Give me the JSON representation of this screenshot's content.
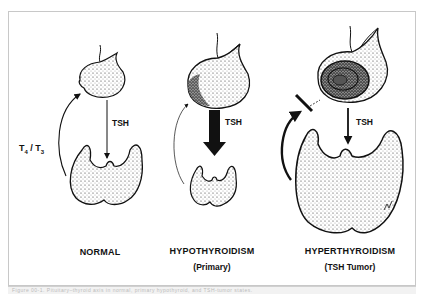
{
  "figure": {
    "panels": [
      {
        "id": "normal",
        "label": "NORMAL",
        "sublabel": "",
        "arrow_label": "TSH",
        "feedback_label": "T4 / T3",
        "feedback": "normal"
      },
      {
        "id": "hypothyroidism",
        "label": "HYPOTHYROIDISM",
        "sublabel": "(Primary)",
        "arrow_label": "TSH",
        "feedback": "weak"
      },
      {
        "id": "hyperthyroidism",
        "label": "HYPERTHYROIDISM",
        "sublabel": "(TSH Tumor)",
        "arrow_label": "TSH",
        "feedback": "blocked"
      }
    ],
    "feedback_label_parts": {
      "t4": "T",
      "t4_sub": "4",
      "sep": " / ",
      "t3": "T",
      "t3_sub": "3"
    },
    "caption": "Figure 00-1. Pituitary–thyroid axis in normal, primary hypothyroid, and TSH-tumor states."
  },
  "colors": {
    "ink": "#111111",
    "frame": "#c8c8c8",
    "caption_bg": "#f2f2f2"
  }
}
